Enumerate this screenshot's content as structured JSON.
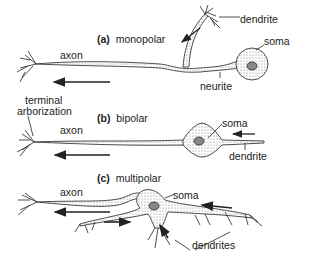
{
  "diagram": {
    "panels": [
      {
        "id": "a",
        "letter": "(a)",
        "name": "monopolar",
        "labels": {
          "dendrite": "dendrite",
          "soma": "soma",
          "axon": "axon",
          "neurite": "neurite"
        }
      },
      {
        "id": "b",
        "letter": "(b)",
        "name": "bipolar",
        "labels": {
          "axon": "axon",
          "soma": "soma",
          "dendrite": "dendrite"
        }
      },
      {
        "id": "c",
        "letter": "(c)",
        "name": "multipolar",
        "labels": {
          "axon": "axon",
          "soma": "soma",
          "dendrites": "dendrites"
        }
      }
    ],
    "shared_labels": {
      "terminal_line1": "terminal",
      "terminal_line2": "arborization"
    },
    "colors": {
      "stroke": "#222222",
      "fill": "#e8e8e8",
      "background": "#ffffff"
    }
  }
}
